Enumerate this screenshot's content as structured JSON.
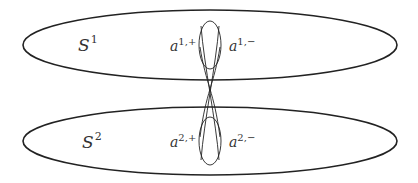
{
  "diagram": {
    "stroke_color": "#222222",
    "surfaces": [
      {
        "id": "S1",
        "base": "S",
        "superscript": "1",
        "cx": 210,
        "cy": 45,
        "rx": 187,
        "ry": 35,
        "label_x": 78,
        "label_y": 51,
        "loop": {
          "cx": 210,
          "cy": 45,
          "rx": 11,
          "ry": 24
        },
        "points": [
          {
            "base": "a",
            "superscript": "1,+",
            "x": 170,
            "y": 51
          },
          {
            "base": "a",
            "superscript": "1,−",
            "x": 229,
            "y": 51
          }
        ]
      },
      {
        "id": "S2",
        "base": "S",
        "superscript": "2",
        "cx": 210,
        "cy": 141,
        "rx": 187,
        "ry": 34,
        "label_x": 82,
        "label_y": 148,
        "loop": {
          "cx": 210,
          "cy": 141,
          "rx": 11,
          "ry": 24
        },
        "points": [
          {
            "base": "a",
            "superscript": "2,+",
            "x": 170,
            "y": 147
          },
          {
            "base": "a",
            "superscript": "2,−",
            "x": 229,
            "y": 147
          }
        ]
      }
    ]
  }
}
